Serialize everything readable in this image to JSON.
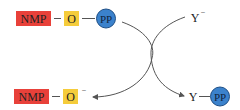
{
  "diagram": {
    "type": "reaction-mechanism",
    "colors": {
      "nmp_fill": "#e8413a",
      "o_fill": "#f5cc3b",
      "pp_fill": "#3b82cc",
      "pp_stroke": "#1f4f86",
      "line": "#555555",
      "text": "#222222"
    },
    "reactant": {
      "nmp_label": "NMP",
      "o_label": "O",
      "pp_label": "PP",
      "bond_1": "—",
      "bond_2": "—"
    },
    "nucleophile": {
      "label": "Y",
      "charge": "−"
    },
    "product_left": {
      "nmp_label": "NMP",
      "o_label": "O",
      "charge": "−",
      "bond": "—"
    },
    "product_right": {
      "y_label": "Y",
      "pp_label": "PP",
      "bond": "—"
    }
  }
}
